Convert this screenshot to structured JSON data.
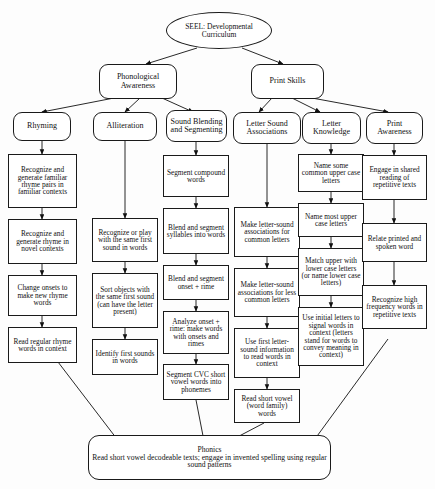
{
  "diagram": {
    "title": "SEEL: Developmental Curriculum",
    "root": {
      "label": "SEEL: Developmental Curriculum"
    },
    "strands": [
      {
        "id": "phonological-awareness",
        "label": "Phonological Awareness"
      },
      {
        "id": "print-skills",
        "label": "Print Skills"
      }
    ],
    "categories": [
      {
        "id": "rhyming",
        "label": "Rhyming"
      },
      {
        "id": "alliteration",
        "label": "Alliteration"
      },
      {
        "id": "sound-blending-and-segmenting",
        "label": "Sound Blending and Segmenting"
      },
      {
        "id": "letter-sound-associations",
        "label": "Letter Sound Associations"
      },
      {
        "id": "letter-knowledge",
        "label": "Letter Knowledge"
      },
      {
        "id": "print-awareness",
        "label": "Print Awareness"
      }
    ],
    "columns": {
      "rhyming": [
        "Recognize and generate familiar rhyme pairs in familiar contexts",
        "Recognize and generate rhyme in novel contexts",
        "Change onsets to make new rhyme words",
        "Read regular rhyme words in context"
      ],
      "alliteration": [
        "Recognize or play with the same first sound in words",
        "Sort objects with the same first sound (can have the letter present)",
        "Identify first sounds in words"
      ],
      "sound_blending_and_segmenting": [
        "Segment compound words",
        "Blend and segment syllables into words",
        "Blend and segment onset + rime",
        "Analyze onset + rime: make words with onsets and rimes",
        "Segment CVC short vowel words into phonemes"
      ],
      "letter_sound_associations": [
        "Make letter-sound associations for common letters",
        "Make letter-sound associations for less common letters",
        "Use first letter-sound information to read words in context",
        "Read short vowel (word family) words"
      ],
      "letter_knowledge": [
        "Name some common upper case letters",
        "Name most upper case letters",
        "Match upper with lower case letters (or name lower case letters)",
        "Use initial letters to signal words in context (letters stand for words to convey meaning in context)"
      ],
      "print_awareness": [
        "Engage in shared reading of repetitive texts",
        "Relate printed and spoken word",
        "Recognize high frequency words in repetitive texts"
      ]
    },
    "outcome": {
      "title": "Phonics",
      "body": "Read short vowel decodeable texts; engage in invented spelling using regular sound patterns"
    }
  }
}
